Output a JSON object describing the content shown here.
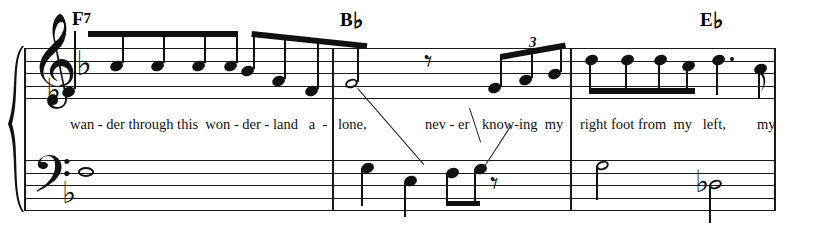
{
  "score": {
    "title_visible": false,
    "clefs": {
      "treble": "treble-clef",
      "bass": "bass-clef"
    },
    "key_signature": {
      "flats": 1,
      "name": "F major / D minor"
    },
    "chords": [
      {
        "root": "F",
        "quality": "7",
        "accidental": "",
        "x": 72,
        "y": 8
      },
      {
        "root": "B",
        "quality": "",
        "accidental": "♭",
        "x": 340,
        "y": 8
      },
      {
        "root": "E",
        "quality": "",
        "accidental": "♭",
        "x": 700,
        "y": 8
      }
    ],
    "lyrics": [
      {
        "text": "wan - der through this  won - der - land   a  -",
        "x": 70
      },
      {
        "text": "lone,",
        "x": 338
      },
      {
        "text": "nev - er",
        "x": 425
      },
      {
        "text": "know-ing  my",
        "x": 482
      },
      {
        "text": "right foot from  my   left,",
        "x": 580
      },
      {
        "text": "my",
        "x": 757
      }
    ],
    "measures": [
      {
        "index": 1,
        "chord": "F7",
        "barline_x": 332
      },
      {
        "index": 2,
        "chord": "Bb",
        "barline_x": 570
      },
      {
        "index": 3,
        "chord": "Eb",
        "barline_x": 774
      }
    ],
    "tuplet": {
      "number": "3",
      "x": 528,
      "y": 36
    },
    "treble_notes": [
      {
        "id": "t1",
        "x": 62,
        "y": 92,
        "type": "eighth",
        "accidental": "♭"
      },
      {
        "id": "t2",
        "x": 110,
        "y": 66,
        "type": "eighth"
      },
      {
        "id": "t3",
        "x": 151,
        "y": 66,
        "type": "eighth"
      },
      {
        "id": "t4",
        "x": 192,
        "y": 66,
        "type": "eighth"
      },
      {
        "id": "t5",
        "x": 228,
        "y": 66,
        "type": "eighth"
      },
      {
        "id": "t6",
        "x": 247,
        "y": 72,
        "type": "eighth"
      },
      {
        "id": "t7",
        "x": 273,
        "y": 80,
        "type": "eighth"
      },
      {
        "id": "t8",
        "x": 303,
        "y": 88,
        "type": "eighth"
      },
      {
        "id": "t9",
        "x": 345,
        "y": 84,
        "type": "half"
      },
      {
        "id": "t10",
        "x": 488,
        "y": 88,
        "type": "eighth-triplet"
      },
      {
        "id": "t11",
        "x": 522,
        "y": 80,
        "type": "eighth-triplet"
      },
      {
        "id": "t12",
        "x": 551,
        "y": 74,
        "type": "eighth-triplet"
      },
      {
        "id": "t13",
        "x": 589,
        "y": 60,
        "type": "eighth"
      },
      {
        "id": "t14",
        "x": 625,
        "y": 60,
        "type": "eighth"
      },
      {
        "id": "t15",
        "x": 658,
        "y": 60,
        "type": "eighth"
      },
      {
        "id": "t16",
        "x": 686,
        "y": 66,
        "type": "eighth"
      },
      {
        "id": "t17",
        "x": 716,
        "y": 60,
        "type": "dotted-quarter"
      },
      {
        "id": "t18",
        "x": 758,
        "y": 72,
        "type": "eighth"
      }
    ],
    "treble_rests": [
      {
        "id": "tr1",
        "x": 428,
        "y": 56,
        "type": "quarter-rest"
      }
    ],
    "bass_notes": [
      {
        "id": "b1",
        "x": 80,
        "y": 173,
        "type": "whole"
      },
      {
        "id": "b2",
        "x": 365,
        "y": 168,
        "type": "quarter"
      },
      {
        "id": "b3",
        "x": 408,
        "y": 180,
        "type": "quarter"
      },
      {
        "id": "b4",
        "x": 450,
        "y": 172,
        "type": "eighth"
      },
      {
        "id": "b5",
        "x": 478,
        "y": 168,
        "type": "eighth"
      },
      {
        "id": "b6",
        "x": 596,
        "y": 166,
        "type": "half"
      },
      {
        "id": "b7",
        "x": 707,
        "y": 185,
        "type": "half",
        "accidental": "♭"
      }
    ],
    "bass_rests": [
      {
        "id": "br1",
        "x": 494,
        "y": 178,
        "type": "quarter-rest"
      }
    ],
    "colors": {
      "ink": "#111111",
      "paper": "#ffffff"
    }
  }
}
